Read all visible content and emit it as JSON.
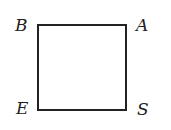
{
  "diagram": {
    "shape": "square",
    "vertices": {
      "top_left": "B",
      "top_right": "A",
      "bottom_left": "E",
      "bottom_right": "S"
    },
    "stroke_color": "#222222"
  }
}
